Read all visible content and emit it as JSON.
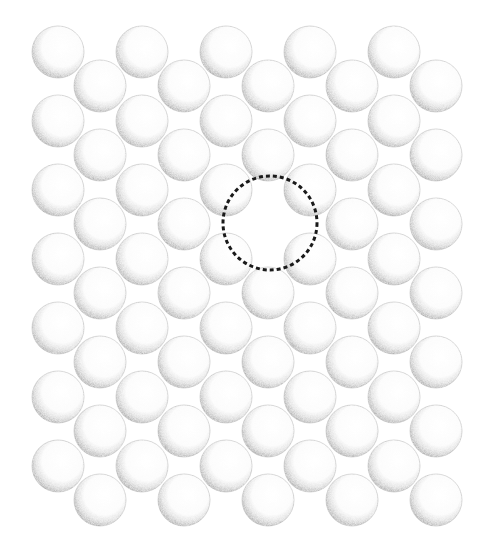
{
  "diagram": {
    "title": "Close-packed sphere lattice with a vacancy",
    "kind": "hexagonal-close-packed-2d-lattice",
    "sphere_radius": 26,
    "colors": {
      "background": "#ffffff",
      "sphere_fill": "#ffffff",
      "sphere_rim": "#9a9a9a",
      "sphere_shadow": "#8a8a8a",
      "vacancy_outline": "#1a1a1a"
    },
    "lattice": {
      "row_a": {
        "x": [
          58,
          142,
          226,
          310,
          394
        ],
        "y": [
          52,
          121,
          190,
          259,
          328,
          397,
          466
        ]
      },
      "row_b": {
        "x": [
          100,
          184,
          268,
          352,
          436
        ],
        "y": [
          86,
          155,
          224,
          293,
          362,
          431,
          500
        ]
      }
    },
    "vacancy": {
      "label": "vacancy",
      "cx": 270,
      "cy": 223,
      "r": 47,
      "style": "dashed",
      "stroke_width": 3
    }
  }
}
